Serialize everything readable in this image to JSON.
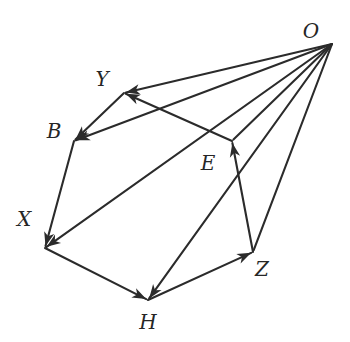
{
  "figure": {
    "type": "directed-graph-diagram",
    "width": 350,
    "height": 342,
    "background_color": "#ffffff",
    "stroke_color": "#2b2b2b",
    "label_color": "#262626"
  },
  "nodes": [
    {
      "id": "O",
      "label": "O",
      "point_x": 332,
      "point_y": 44,
      "label_x": 311,
      "label_y": 31
    },
    {
      "id": "Y",
      "label": "Y",
      "point_x": 124,
      "point_y": 93,
      "label_x": 102,
      "label_y": 79
    },
    {
      "id": "B",
      "label": "B",
      "point_x": 74,
      "point_y": 141,
      "label_x": 54,
      "label_y": 131
    },
    {
      "id": "E",
      "label": "E",
      "point_x": 232,
      "point_y": 141,
      "label_x": 208,
      "label_y": 163
    },
    {
      "id": "X",
      "label": "X",
      "point_x": 45,
      "point_y": 248,
      "label_x": 24,
      "label_y": 219
    },
    {
      "id": "Z",
      "label": "Z",
      "point_x": 253,
      "point_y": 252,
      "label_x": 262,
      "label_y": 269
    },
    {
      "id": "H",
      "label": "H",
      "point_x": 148,
      "point_y": 300,
      "label_x": 148,
      "label_y": 322
    }
  ],
  "edges": [
    {
      "id": "edge-O-Y",
      "from": "O",
      "to": "Y",
      "arrow": "to",
      "x1": 332,
      "y1": 44,
      "x2": 124,
      "y2": 93
    },
    {
      "id": "edge-O-B",
      "from": "O",
      "to": "B",
      "arrow": "to",
      "x1": 332,
      "y1": 44,
      "x2": 74,
      "y2": 141
    },
    {
      "id": "edge-O-E",
      "from": "O",
      "to": "E",
      "arrow": "none",
      "x1": 332,
      "y1": 44,
      "x2": 232,
      "y2": 141
    },
    {
      "id": "edge-O-X",
      "from": "O",
      "to": "X",
      "arrow": "to",
      "x1": 332,
      "y1": 44,
      "x2": 45,
      "y2": 248
    },
    {
      "id": "edge-O-H",
      "from": "O",
      "to": "H",
      "arrow": "to",
      "x1": 332,
      "y1": 44,
      "x2": 148,
      "y2": 300
    },
    {
      "id": "edge-O-Z",
      "from": "O",
      "to": "Z",
      "arrow": "none",
      "x1": 332,
      "y1": 44,
      "x2": 253,
      "y2": 252
    },
    {
      "id": "edge-Y-B",
      "from": "Y",
      "to": "B",
      "arrow": "to",
      "x1": 124,
      "y1": 93,
      "x2": 74,
      "y2": 141
    },
    {
      "id": "edge-B-X",
      "from": "B",
      "to": "X",
      "arrow": "to",
      "x1": 74,
      "y1": 141,
      "x2": 45,
      "y2": 248
    },
    {
      "id": "edge-X-H",
      "from": "X",
      "to": "H",
      "arrow": "to",
      "x1": 45,
      "y1": 248,
      "x2": 148,
      "y2": 300
    },
    {
      "id": "edge-H-Z",
      "from": "H",
      "to": "Z",
      "arrow": "to",
      "x1": 148,
      "y1": 300,
      "x2": 253,
      "y2": 252
    },
    {
      "id": "edge-Z-E",
      "from": "Z",
      "to": "E",
      "arrow": "to",
      "x1": 253,
      "y1": 252,
      "x2": 232,
      "y2": 141
    },
    {
      "id": "edge-E-Y",
      "from": "E",
      "to": "Y",
      "arrow": "to",
      "x1": 232,
      "y1": 141,
      "x2": 124,
      "y2": 93
    }
  ]
}
